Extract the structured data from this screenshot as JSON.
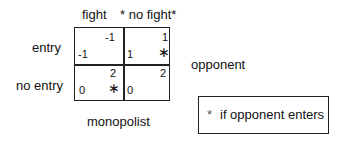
{
  "columns": {
    "fight": "fight",
    "no_fight": "* no fight*"
  },
  "rows": {
    "entry": "entry",
    "no_entry": "no entry"
  },
  "cells": {
    "entry_fight": {
      "top": "-1",
      "bottom": "-1",
      "star": ""
    },
    "entry_nofight": {
      "top": "1",
      "bottom": "1",
      "star": "∗"
    },
    "noentry_fight": {
      "top": "2",
      "bottom": "0",
      "star": "∗"
    },
    "noentry_nofight": {
      "top": "2",
      "bottom": "0",
      "star": ""
    }
  },
  "side_label": "opponent",
  "bottom_label": "monopolist",
  "legend": {
    "star": "*",
    "text": "if opponent enters"
  }
}
